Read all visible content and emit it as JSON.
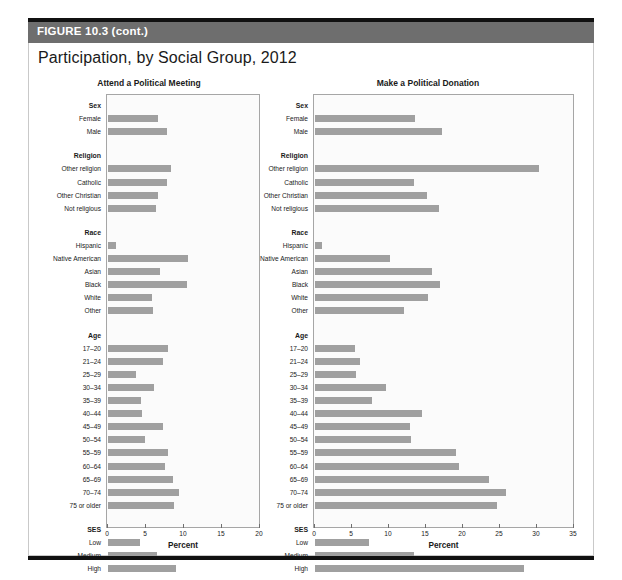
{
  "figure": {
    "band_label": "FIGURE 10.3 (cont.)",
    "title": "Participation, by Social Group, 2012"
  },
  "chart_data": [
    {
      "type": "bar",
      "orientation": "horizontal",
      "title": "Attend a Political Meeting",
      "xlabel": "Percent",
      "ylabel": "",
      "xlim": [
        0,
        20
      ],
      "xticks": [
        "0",
        "5",
        "10",
        "15",
        "20"
      ],
      "grid": false,
      "legend": "none",
      "groups": [
        {
          "name": "Sex",
          "categories": [
            "Female",
            "Male"
          ],
          "values": [
            6.6,
            7.7
          ]
        },
        {
          "name": "Religion",
          "categories": [
            "Other religion",
            "Catholic",
            "Other Christian",
            "Not religious"
          ],
          "values": [
            8.3,
            7.7,
            6.6,
            6.3
          ]
        },
        {
          "name": "Race",
          "categories": [
            "Hispanic",
            "Native American",
            "Asian",
            "Black",
            "White",
            "Other"
          ],
          "values": [
            1.1,
            10.5,
            6.9,
            10.4,
            5.8,
            5.9
          ]
        },
        {
          "name": "Age",
          "categories": [
            "17–20",
            "21–24",
            "25–29",
            "30–34",
            "35–39",
            "40–44",
            "45–49",
            "50–54",
            "55–59",
            "60–64",
            "65–69",
            "70–74",
            "75 or older"
          ],
          "values": [
            7.9,
            7.3,
            3.7,
            6.1,
            4.4,
            4.5,
            7.3,
            4.9,
            7.9,
            7.5,
            8.6,
            9.3,
            8.7
          ]
        },
        {
          "name": "SES",
          "categories": [
            "Low",
            "Medium",
            "High"
          ],
          "values": [
            4.2,
            6.5,
            9.0
          ]
        }
      ]
    },
    {
      "type": "bar",
      "orientation": "horizontal",
      "title": "Make a Political Donation",
      "xlabel": "Percent",
      "ylabel": "",
      "xlim": [
        0,
        35
      ],
      "xticks": [
        "0",
        "5",
        "10",
        "15",
        "20",
        "25",
        "30",
        "35"
      ],
      "grid": false,
      "legend": "none",
      "groups": [
        {
          "name": "Sex",
          "categories": [
            "Female",
            "Male"
          ],
          "values": [
            13.5,
            17.1
          ]
        },
        {
          "name": "Religion",
          "categories": [
            "Other religion",
            "Catholic",
            "Other Christian",
            "Not religious"
          ],
          "values": [
            30.3,
            13.4,
            15.2,
            16.8
          ]
        },
        {
          "name": "Race",
          "categories": [
            "Hispanic",
            "Native American",
            "Asian",
            "Black",
            "White",
            "Other"
          ],
          "values": [
            1.0,
            10.1,
            15.8,
            16.9,
            15.3,
            12.0
          ]
        },
        {
          "name": "Age",
          "categories": [
            "17–20",
            "21–24",
            "25–29",
            "30–34",
            "35–39",
            "40–44",
            "45–49",
            "50–54",
            "55–59",
            "60–64",
            "65–69",
            "70–74",
            "75 or older"
          ],
          "values": [
            5.4,
            6.1,
            5.5,
            9.6,
            7.7,
            14.5,
            12.9,
            13.0,
            19.0,
            19.4,
            23.5,
            25.8,
            24.6
          ]
        },
        {
          "name": "SES",
          "categories": [
            "Low",
            "Medium",
            "High"
          ],
          "values": [
            7.3,
            13.4,
            28.2
          ]
        }
      ]
    }
  ],
  "style": {
    "bar_color": "#a0a0a0",
    "band_color": "#6e6e6e",
    "rule_color": "#111111"
  }
}
